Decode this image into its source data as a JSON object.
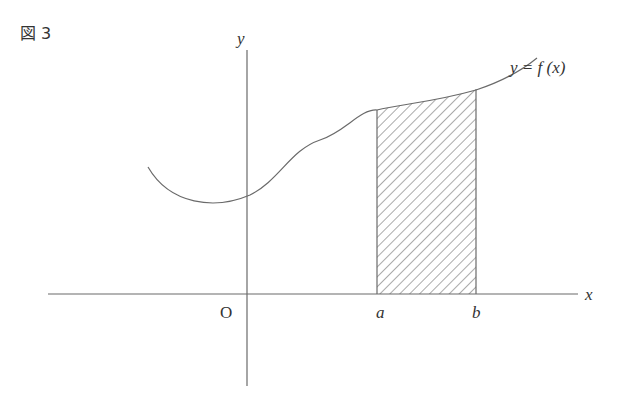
{
  "figure": {
    "label": "図 3",
    "x_axis_label": "x",
    "y_axis_label": "y",
    "origin_label": "O",
    "point_a_label": "a",
    "point_b_label": "b",
    "curve_label": "y = f (x)"
  },
  "colors": {
    "line": "#6a6a6a",
    "text": "#333333",
    "hatch": "#555555"
  }
}
